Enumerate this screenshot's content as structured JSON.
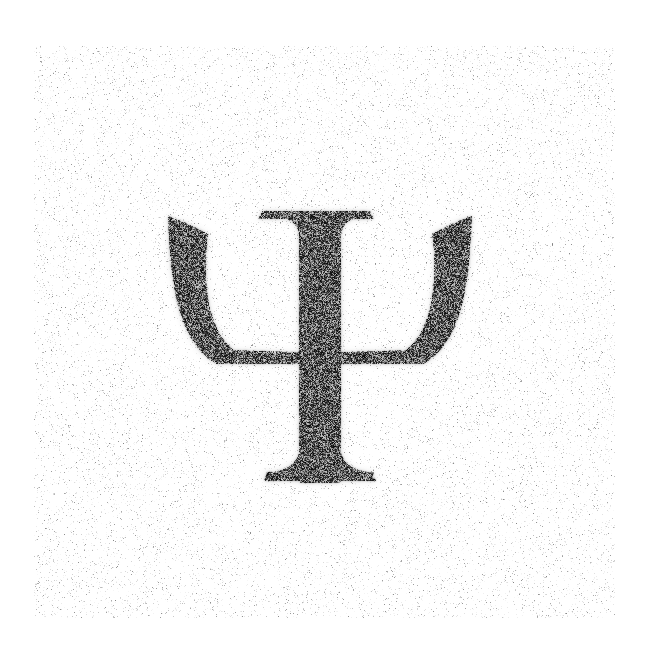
{
  "image": {
    "width": 645,
    "height": 652,
    "background_color": "#ffffff",
    "title": "Noisy rendering of Greek capital letter Psi"
  },
  "glyph": {
    "character": "Ψ",
    "name": "greek-capital-letter-psi",
    "font_style": "serif",
    "ink_color": "#1a1a1a",
    "bounding_box": {
      "x": 168,
      "y": 212,
      "width": 304,
      "height": 271
    },
    "center": {
      "x": 320,
      "y": 347
    },
    "cap_height_px": 271,
    "parts": [
      {
        "name": "top-serif",
        "x": 258,
        "y": 211,
        "width": 116,
        "height": 8
      },
      {
        "name": "vertical-stem",
        "x": 292,
        "y": 212,
        "width": 42,
        "height": 271
      },
      {
        "name": "left-arm",
        "x": 168,
        "y": 216,
        "width": 110,
        "height": 152
      },
      {
        "name": "right-arm",
        "x": 362,
        "y": 216,
        "width": 110,
        "height": 152
      },
      {
        "name": "bowl-joint",
        "x": 226,
        "y": 352,
        "width": 190,
        "height": 12
      },
      {
        "name": "bottom-serif",
        "x": 264,
        "y": 470,
        "width": 112,
        "height": 11
      }
    ]
  },
  "noise": {
    "type": "speckle",
    "region": {
      "x": 34,
      "y": 46,
      "width": 581,
      "height": 572
    },
    "background_density_pct": 7,
    "background_tint": "#d8d8d8",
    "ink_dither_density_pct": 58,
    "ink_dark_color": "#111111",
    "blur_radius_px": 1.2,
    "seed": 20240613
  }
}
